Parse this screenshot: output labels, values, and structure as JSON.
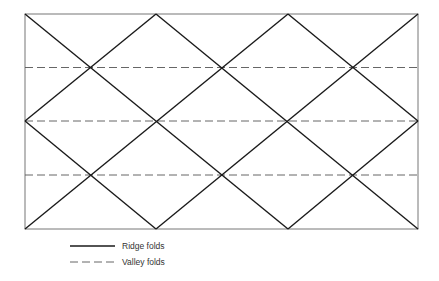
{
  "diagram": {
    "frame": {
      "x0": 25,
      "y0": 14,
      "x1": 418,
      "y1": 229
    },
    "ridge_color": "#1a1a1a",
    "valley_color": "#555555",
    "ridge_lines": [
      [
        [
          25,
          14
        ],
        [
          288,
          229
        ]
      ],
      [
        [
          156,
          14
        ],
        [
          418,
          229
        ]
      ],
      [
        [
          288,
          14
        ],
        [
          418,
          121
        ]
      ],
      [
        [
          25,
          121
        ],
        [
          156,
          229
        ]
      ],
      [
        [
          156,
          14
        ],
        [
          25,
          121
        ]
      ],
      [
        [
          288,
          14
        ],
        [
          25,
          229
        ]
      ],
      [
        [
          418,
          14
        ],
        [
          156,
          229
        ]
      ],
      [
        [
          418,
          121
        ],
        [
          288,
          229
        ]
      ]
    ],
    "valley_lines": [
      67.5,
      121,
      175
    ]
  },
  "legend": {
    "items": [
      {
        "label": "Ridge folds",
        "style": "solid"
      },
      {
        "label": "Valley folds",
        "style": "dashed"
      }
    ]
  }
}
